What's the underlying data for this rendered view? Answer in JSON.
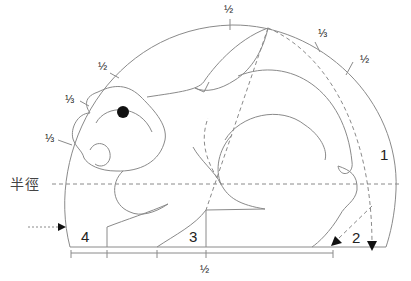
{
  "diagram": {
    "title": "",
    "labels": {
      "radius": "半徑",
      "num1": "1",
      "num2": "2",
      "num3": "3",
      "num4": "4",
      "frac_top": "½",
      "frac_upper_right_third": "⅓",
      "frac_right_half": "½",
      "frac_left_half": "½",
      "frac_left_third_upper": "⅓",
      "frac_left_third_lower": "⅓",
      "frac_bottom": "½"
    },
    "colors": {
      "line": "#8a8a8a",
      "dashed": "#8a8a8a",
      "eye": "#111111",
      "text": "#222222"
    }
  }
}
